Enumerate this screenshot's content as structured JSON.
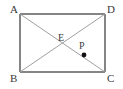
{
  "figure": {
    "type": "geometry-diagram",
    "shape": "rectangle",
    "background_color": "#ffffff",
    "outline_color": "#5c5c5e",
    "diagonal_color": "#a0a0a2",
    "point_color": "#111111",
    "label_color": "#39393b",
    "labels": {
      "A": "A",
      "B": "B",
      "C": "C",
      "D": "D",
      "E": "E",
      "P": "P"
    },
    "vertices": [
      {
        "name": "A",
        "x": 20,
        "y": 14
      },
      {
        "name": "D",
        "x": 105,
        "y": 14
      },
      {
        "name": "C",
        "x": 105,
        "y": 72
      },
      {
        "name": "B",
        "x": 20,
        "y": 72
      }
    ],
    "segments": [
      {
        "name": "side-AD",
        "x1": 20,
        "y1": 14,
        "x2": 105,
        "y2": 14
      },
      {
        "name": "side-DC",
        "x1": 105,
        "y1": 14,
        "x2": 105,
        "y2": 72
      },
      {
        "name": "side-BC",
        "x1": 20,
        "y1": 72,
        "x2": 105,
        "y2": 72
      },
      {
        "name": "side-AB",
        "x1": 20,
        "y1": 14,
        "x2": 20,
        "y2": 72
      },
      {
        "name": "diagonal-AC",
        "x1": 20,
        "y1": 14,
        "x2": 105,
        "y2": 72
      },
      {
        "name": "diagonal-BD",
        "x1": 20,
        "y1": 72,
        "x2": 105,
        "y2": 14
      }
    ],
    "points": [
      {
        "name": "E",
        "x": 62.5,
        "y": 43,
        "marked": false
      },
      {
        "name": "P",
        "x": 84,
        "y": 55,
        "marked": true,
        "radius": 2.4
      }
    ]
  }
}
